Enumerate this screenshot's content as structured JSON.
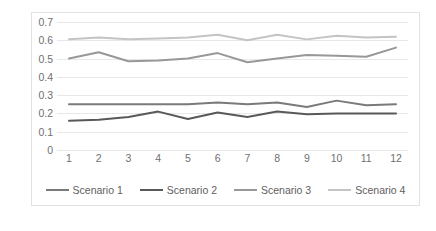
{
  "chart_data": {
    "type": "line",
    "title": "",
    "xlabel": "",
    "ylabel": "",
    "categories": [
      "1",
      "2",
      "3",
      "4",
      "5",
      "6",
      "7",
      "8",
      "9",
      "10",
      "11",
      "12"
    ],
    "ylim": [
      0,
      0.7
    ],
    "ytick_labels": [
      "0",
      "0.1",
      "0.2",
      "0.3",
      "0.4",
      "0.5",
      "0.6",
      "0.7"
    ],
    "ytick_values": [
      0,
      0.1,
      0.2,
      0.3,
      0.4,
      0.5,
      0.6,
      0.7
    ],
    "grid": true,
    "legend_position": "bottom",
    "series": [
      {
        "name": "Scenario 1",
        "color": "#7a7a7a",
        "values": [
          0.25,
          0.25,
          0.25,
          0.25,
          0.25,
          0.26,
          0.25,
          0.26,
          0.235,
          0.27,
          0.245,
          0.25
        ]
      },
      {
        "name": "Scenario 2",
        "color": "#595959",
        "values": [
          0.16,
          0.165,
          0.18,
          0.21,
          0.17,
          0.205,
          0.18,
          0.21,
          0.195,
          0.2,
          0.2,
          0.2
        ]
      },
      {
        "name": "Scenario 3",
        "color": "#989898",
        "values": [
          0.5,
          0.535,
          0.485,
          0.49,
          0.5,
          0.53,
          0.48,
          0.5,
          0.52,
          0.515,
          0.51,
          0.56
        ]
      },
      {
        "name": "Scenario 4",
        "color": "#c4c4c4",
        "values": [
          0.605,
          0.615,
          0.605,
          0.61,
          0.615,
          0.63,
          0.6,
          0.63,
          0.605,
          0.625,
          0.615,
          0.62
        ]
      }
    ]
  },
  "legend": {
    "items": [
      {
        "label": "Scenario 1"
      },
      {
        "label": "Scenario 2"
      },
      {
        "label": "Scenario 3"
      },
      {
        "label": "Scenario 4"
      }
    ]
  },
  "colors": {
    "gridline": "#e8e8e8",
    "frame_border": "#e2e2e2",
    "tick_text": "#6f6f6f",
    "legend_text": "#5e5e5e",
    "background": "#ffffff"
  }
}
